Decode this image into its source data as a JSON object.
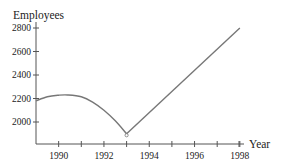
{
  "chart_data": {
    "type": "line",
    "title": "",
    "xlabel": "Year",
    "ylabel": "Employees",
    "xlim": [
      1989,
      1998
    ],
    "ylim": [
      1800,
      2800
    ],
    "grid": false,
    "legend": null,
    "x_ticks": [
      1989,
      1990,
      1991,
      1992,
      1993,
      1994,
      1995,
      1996,
      1997,
      1998
    ],
    "x_tick_labels": [
      "1990",
      "1992",
      "1994",
      "1996",
      "1998"
    ],
    "x_tick_label_values": [
      1990,
      1992,
      1994,
      1996,
      1998
    ],
    "y_ticks": [
      2000,
      2200,
      2400,
      2600,
      2800
    ],
    "y_tick_labels": [
      "2000",
      "2200",
      "2400",
      "2600",
      "2800"
    ],
    "series": [
      {
        "name": "Employees",
        "segments": [
          {
            "shape": "curve (concave down)",
            "x": [
              1989,
              1989.5,
              1990,
              1990.4,
              1991,
              1991.5,
              1992,
              1992.5,
              1993
            ],
            "y": [
              2180,
              2215,
              2228,
              2230,
              2215,
              2170,
              2100,
              2010,
              1900
            ]
          },
          {
            "shape": "straight line",
            "x": [
              1993,
              1998
            ],
            "y": [
              1900,
              2800
            ]
          }
        ]
      }
    ],
    "annotations": [
      {
        "type": "open-point",
        "x": 1993,
        "y": 1900
      }
    ],
    "color": "#777777"
  }
}
